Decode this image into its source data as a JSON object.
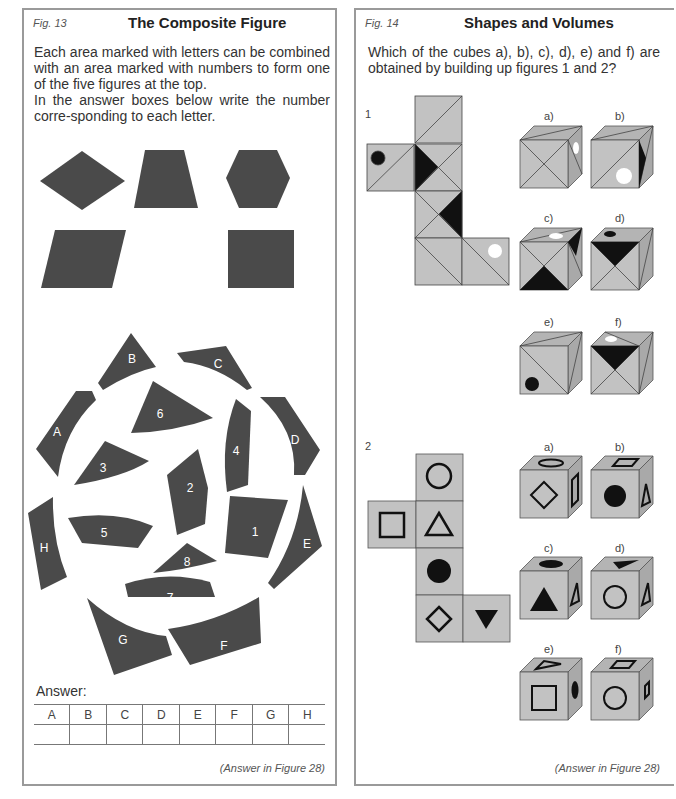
{
  "left": {
    "fig": "Fig. 13",
    "title": "The Composite Figure",
    "intro_line1": "Each area marked with letters can be combined with an area marked with numbers to form one of the five figures at the top.",
    "intro_line2": "In the answer boxes below write the number corre-sponding to each letter.",
    "target_shapes": [
      "rhombus",
      "trapezoid",
      "hexagon",
      "parallelogram",
      "rectangle"
    ],
    "letter_pieces": [
      "A",
      "B",
      "C",
      "D",
      "E",
      "F",
      "G",
      "H"
    ],
    "number_pieces": [
      "1",
      "2",
      "3",
      "4",
      "5",
      "6",
      "7",
      "8"
    ],
    "answer_label": "Answer:",
    "answer_columns": [
      "A",
      "B",
      "C",
      "D",
      "E",
      "F",
      "G",
      "H"
    ],
    "answer_values": [
      "",
      "",
      "",
      "",
      "",
      "",
      "",
      ""
    ],
    "answer_ref": "(Answer in Figure 28)"
  },
  "right": {
    "fig": "Fig. 14",
    "title": "Shapes and Volumes",
    "intro": "Which of the cubes a), b), c), d), e) and f) are obtained by building up figures 1 and 2?",
    "net1_label": "1",
    "net2_label": "2",
    "cube_labels": [
      "a)",
      "b)",
      "c)",
      "d)",
      "e)",
      "f)"
    ],
    "answer_ref": "(Answer in Figure 28)"
  },
  "colors": {
    "piece": "#4a4a4a",
    "face": "#c2c2c2",
    "face_top": "#b0b0b0",
    "face_side": "#a8a8a8",
    "border": "#9a9a9a"
  }
}
